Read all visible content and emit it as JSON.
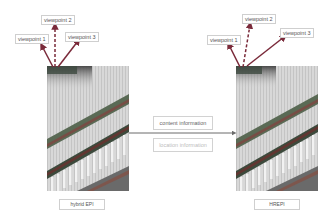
{
  "left_panel": {
    "viewpoints": [
      {
        "label": "viewpoint 1"
      },
      {
        "label": "viewpoint 2"
      },
      {
        "label": "viewpoint 3"
      }
    ],
    "caption": "hybrid EPI"
  },
  "right_panel": {
    "viewpoints": [
      {
        "label": "viewpoint 1"
      },
      {
        "label": "viewpoint 2"
      },
      {
        "label": "viewpoint 3"
      }
    ],
    "caption": "HREPI"
  },
  "transfer": {
    "content_label": "content information",
    "location_label": "location information"
  },
  "colors": {
    "arrow": "#7a2a3a",
    "connector": "#6b6b6b",
    "location_text": "#bdbdbd",
    "content_text": "#666666"
  }
}
